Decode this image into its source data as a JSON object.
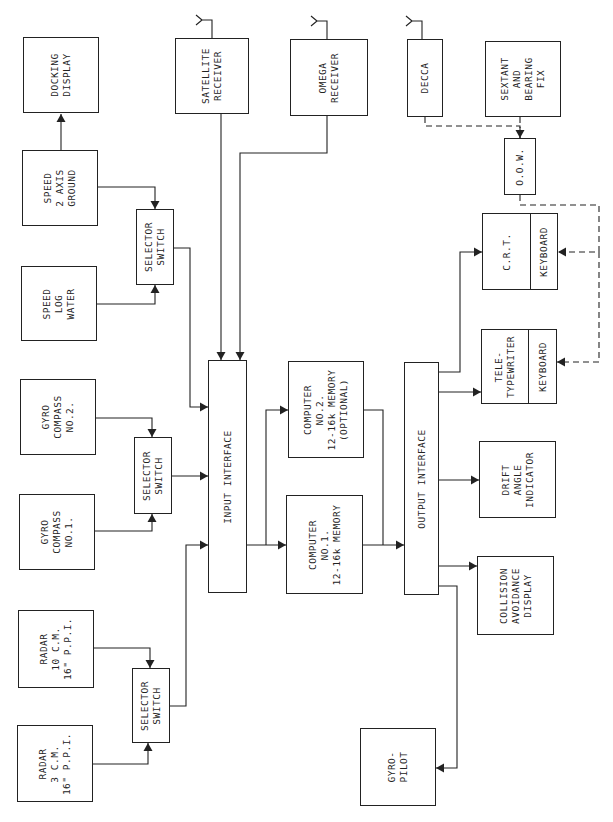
{
  "diagram": {
    "title": "",
    "colors": {
      "line": "#222222",
      "background": "#ffffff"
    },
    "nodes": [
      {
        "id": "docking_display",
        "label": "DOCKING\nDISPLAY",
        "x": 23,
        "y": 37,
        "w": 76,
        "h": 76
      },
      {
        "id": "speed_ground",
        "label": "SPEED\n2 AXIS\nGROUND",
        "x": 22,
        "y": 150,
        "w": 76,
        "h": 76
      },
      {
        "id": "speed_water",
        "label": "SPEED\nLOG\nWATER",
        "x": 21,
        "y": 266,
        "w": 76,
        "h": 75
      },
      {
        "id": "gyro2",
        "label": "GYRO\nCOMPASS\nNO.2.",
        "x": 20,
        "y": 379,
        "w": 76,
        "h": 76
      },
      {
        "id": "gyro1",
        "label": "GYRO\nCOMPASS\nNO.1.",
        "x": 19,
        "y": 494,
        "w": 76,
        "h": 76
      },
      {
        "id": "radar10",
        "label": "RADAR\n10 C.M.\n16\" P.P.I.",
        "x": 18,
        "y": 610,
        "w": 76,
        "h": 78
      },
      {
        "id": "radar3",
        "label": "RADAR\n3 C.M.\n16\" P.P.I.",
        "x": 17,
        "y": 725,
        "w": 76,
        "h": 77
      },
      {
        "id": "selector1",
        "label": "SELECTOR\nSWITCH",
        "x": 136,
        "y": 209,
        "w": 38,
        "h": 76
      },
      {
        "id": "selector2",
        "label": "SELECTOR\nSWITCH",
        "x": 134,
        "y": 437,
        "w": 38,
        "h": 77
      },
      {
        "id": "selector3",
        "label": "SELECTOR\nSWITCH",
        "x": 132,
        "y": 668,
        "w": 38,
        "h": 75
      },
      {
        "id": "satellite",
        "label": "SATELLITE\nRECEIVER",
        "x": 175,
        "y": 38,
        "w": 74,
        "h": 76
      },
      {
        "id": "omega",
        "label": "OMEGA\nRECEIVER",
        "x": 290,
        "y": 39,
        "w": 78,
        "h": 77
      },
      {
        "id": "decca",
        "label": "DECCA",
        "x": 407,
        "y": 39,
        "w": 36,
        "h": 78
      },
      {
        "id": "sextant",
        "label": "SEXTANT\nAND\nBEARING\nFIX",
        "x": 485,
        "y": 41,
        "w": 76,
        "h": 76
      },
      {
        "id": "oow",
        "label": "O.O.W.",
        "x": 504,
        "y": 138,
        "w": 32,
        "h": 57
      },
      {
        "id": "input_interface",
        "label": "INPUT INTERFACE",
        "x": 208,
        "y": 360,
        "w": 39,
        "h": 233
      },
      {
        "id": "computer2",
        "label": "COMPUTER\nNO.2.\n12-16k MEMORY\n(OPTIONAL)",
        "x": 288,
        "y": 361,
        "w": 76,
        "h": 97
      },
      {
        "id": "computer1",
        "label": "COMPUTER\nNO.1.\n12-16k MEMORY",
        "x": 286,
        "y": 495,
        "w": 77,
        "h": 99
      },
      {
        "id": "output_interface",
        "label": "OUTPUT INTERFACE",
        "x": 404,
        "y": 362,
        "w": 35,
        "h": 233
      },
      {
        "id": "drift",
        "label": "DRIFT\nANGLE\nINDICATOR",
        "x": 479,
        "y": 441,
        "w": 77,
        "h": 77
      },
      {
        "id": "collision",
        "label": "COLLISION\nAVOIDANCE\nDISPLAY",
        "x": 477,
        "y": 556,
        "w": 77,
        "h": 79
      },
      {
        "id": "gyropilot",
        "label": "GYRO-\nPILOT",
        "x": 360,
        "y": 728,
        "w": 76,
        "h": 78
      }
    ],
    "split_nodes": [
      {
        "id": "crt",
        "label": "C.R.T.",
        "sub_label": "KEYBOARD",
        "x": 482,
        "y": 213,
        "w": 76,
        "h": 77,
        "divider": 48
      },
      {
        "id": "teletypewriter",
        "label": "TELE-\nTYPEWRITER",
        "sub_label": "KEYBOARD",
        "x": 481,
        "y": 329,
        "w": 76,
        "h": 75,
        "divider": 47
      }
    ],
    "antennas": [
      {
        "for": "satellite",
        "x": 212,
        "y": 38
      },
      {
        "for": "omega",
        "x": 327,
        "y": 39
      },
      {
        "for": "decca",
        "x": 422,
        "y": 39
      }
    ],
    "edges": [
      {
        "from": "speed_ground",
        "to": "docking_display",
        "points": [
          [
            61,
            150
          ],
          [
            61,
            114
          ]
        ],
        "arrow": true,
        "dashed": false
      },
      {
        "from": "speed_ground",
        "to": "selector1",
        "points": [
          [
            98,
            187
          ],
          [
            155,
            187
          ],
          [
            155,
            209
          ]
        ],
        "arrow": true,
        "dashed": false
      },
      {
        "from": "speed_water",
        "to": "selector1",
        "points": [
          [
            97,
            304
          ],
          [
            155,
            304
          ],
          [
            155,
            285
          ]
        ],
        "arrow": true,
        "dashed": false
      },
      {
        "from": "selector1",
        "to": "input_interface",
        "points": [
          [
            174,
            248
          ],
          [
            190,
            248
          ],
          [
            190,
            407
          ],
          [
            208,
            407
          ]
        ],
        "arrow": true,
        "dashed": false
      },
      {
        "from": "gyro2",
        "to": "selector2",
        "points": [
          [
            96,
            418
          ],
          [
            152,
            418
          ],
          [
            152,
            437
          ]
        ],
        "arrow": true,
        "dashed": false
      },
      {
        "from": "gyro1",
        "to": "selector2",
        "points": [
          [
            95,
            531
          ],
          [
            152,
            531
          ],
          [
            152,
            514
          ]
        ],
        "arrow": true,
        "dashed": false
      },
      {
        "from": "selector2",
        "to": "input_interface",
        "points": [
          [
            172,
            476
          ],
          [
            208,
            476
          ]
        ],
        "arrow": true,
        "dashed": false
      },
      {
        "from": "radar10",
        "to": "selector3",
        "points": [
          [
            94,
            648
          ],
          [
            150,
            648
          ],
          [
            150,
            668
          ]
        ],
        "arrow": true,
        "dashed": false
      },
      {
        "from": "radar3",
        "to": "selector3",
        "points": [
          [
            93,
            764
          ],
          [
            148,
            764
          ],
          [
            148,
            743
          ]
        ],
        "arrow": true,
        "dashed": false
      },
      {
        "from": "selector3",
        "to": "input_interface",
        "points": [
          [
            170,
            706
          ],
          [
            186,
            706
          ],
          [
            186,
            545
          ],
          [
            208,
            545
          ]
        ],
        "arrow": true,
        "dashed": false
      },
      {
        "from": "satellite",
        "to": "input_interface",
        "points": [
          [
            221,
            114
          ],
          [
            221,
            360
          ]
        ],
        "arrow": true,
        "dashed": false
      },
      {
        "from": "omega",
        "to": "input_interface",
        "points": [
          [
            327,
            116
          ],
          [
            327,
            153
          ],
          [
            240,
            153
          ],
          [
            240,
            360
          ]
        ],
        "arrow": true,
        "dashed": false
      },
      {
        "from": "input_interface",
        "to": "computer1",
        "points": [
          [
            247,
            545
          ],
          [
            286,
            545
          ]
        ],
        "arrow": true,
        "dashed": false
      },
      {
        "from": "input_interface",
        "to": "computer2",
        "points": [
          [
            266,
            545
          ],
          [
            266,
            410
          ],
          [
            288,
            410
          ]
        ],
        "arrow": true,
        "dashed": false
      },
      {
        "from": "computer1",
        "to": "output_interface",
        "points": [
          [
            363,
            545
          ],
          [
            404,
            545
          ]
        ],
        "arrow": true,
        "dashed": false
      },
      {
        "from": "computer2",
        "to": "output_interface",
        "points": [
          [
            364,
            410
          ],
          [
            383,
            410
          ],
          [
            383,
            545
          ]
        ],
        "arrow": false,
        "dashed": false
      },
      {
        "from": "output_interface",
        "to": "crt",
        "points": [
          [
            439,
            372
          ],
          [
            460,
            372
          ],
          [
            460,
            252
          ],
          [
            482,
            252
          ]
        ],
        "arrow": true,
        "dashed": false
      },
      {
        "from": "output_interface",
        "to": "teletypewriter",
        "points": [
          [
            439,
            392
          ],
          [
            481,
            392
          ]
        ],
        "arrow": true,
        "dashed": false
      },
      {
        "from": "output_interface",
        "to": "drift",
        "points": [
          [
            439,
            480
          ],
          [
            479,
            480
          ]
        ],
        "arrow": true,
        "dashed": false
      },
      {
        "from": "output_interface",
        "to": "collision",
        "points": [
          [
            439,
            566
          ],
          [
            477,
            566
          ]
        ],
        "arrow": true,
        "dashed": false
      },
      {
        "from": "output_interface",
        "to": "gyropilot",
        "points": [
          [
            439,
            586
          ],
          [
            457,
            586
          ],
          [
            457,
            768
          ],
          [
            436,
            768
          ]
        ],
        "arrow": true,
        "dashed": false
      },
      {
        "from": "decca",
        "to": "oow",
        "points": [
          [
            425,
            117
          ],
          [
            425,
            126
          ],
          [
            520,
            126
          ],
          [
            520,
            138
          ]
        ],
        "arrow": true,
        "dashed": true
      },
      {
        "from": "sextant",
        "to": "oow",
        "points": [
          [
            520,
            117
          ],
          [
            520,
            138
          ]
        ],
        "arrow": false,
        "dashed": true
      },
      {
        "from": "oow",
        "to": "crt_keyboard",
        "points": [
          [
            520,
            195
          ],
          [
            520,
            205
          ],
          [
            599,
            205
          ],
          [
            599,
            252
          ],
          [
            558,
            252
          ]
        ],
        "arrow": true,
        "dashed": true
      },
      {
        "from": "oow",
        "to": "teletype_keyboard",
        "points": [
          [
            599,
            252
          ],
          [
            599,
            362
          ],
          [
            557,
            362
          ]
        ],
        "arrow": true,
        "dashed": true
      }
    ]
  }
}
